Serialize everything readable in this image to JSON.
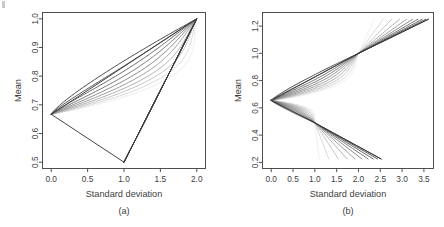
{
  "figure": {
    "background": "#ffffff",
    "ink": "#3d3d3d"
  },
  "chart_data": [
    {
      "type": "line",
      "panel_label": "(a)",
      "title": "",
      "xlabel": "Standard deviation",
      "ylabel": "Mean",
      "xlim": [
        -0.12,
        2.12
      ],
      "ylim": [
        0.478,
        1.022
      ],
      "xticks": [
        "0.0",
        "0.5",
        "1.0",
        "1.5",
        "2.0"
      ],
      "xtick_values": [
        0.0,
        0.5,
        1.0,
        1.5,
        2.0
      ],
      "yticks": [
        "0.5",
        "0.6",
        "0.7",
        "0.8",
        "0.9",
        "1.0"
      ],
      "ytick_values": [
        0.5,
        0.6,
        0.7,
        0.8,
        0.9,
        1.0
      ],
      "grid": false,
      "legend": "none",
      "n_curves": 10,
      "shared_apex_top": [
        2.0,
        1.0
      ],
      "shared_apex_bottom": [
        1.0,
        0.5
      ],
      "left_cusp": [
        0.0,
        0.667
      ],
      "curve_shading": [
        "#3c3c3c",
        "#f0f0f0"
      ],
      "series": [
        {
          "name": "curve-1",
          "color": "#3a3a3a",
          "x": [
            0.0,
            0.02,
            0.06,
            0.14,
            0.26,
            0.42,
            0.6,
            0.78,
            0.9,
            0.97,
            1.0,
            1.18,
            1.4,
            1.62,
            1.82,
            2.0
          ],
          "y": [
            0.667,
            0.69,
            0.725,
            0.772,
            0.82,
            0.866,
            0.906,
            0.94,
            0.962,
            0.98,
            1.0,
            0.905,
            0.79,
            0.69,
            0.594,
            0.5
          ],
          "note": "outermost triangle-like hull; upper branch 0.667->1.0 at sd 2.0, lower branch back to 1.0,0.5"
        },
        {
          "name": "curve-2",
          "color": "#4a4a4a",
          "bulge": 0.4
        },
        {
          "name": "curve-3",
          "color": "#5c5c5c",
          "bulge": 0.5
        },
        {
          "name": "curve-4",
          "color": "#6e6e6e",
          "bulge": 0.58
        },
        {
          "name": "curve-5",
          "color": "#828282",
          "bulge": 0.66
        },
        {
          "name": "curve-6",
          "color": "#969696",
          "bulge": 0.73
        },
        {
          "name": "curve-7",
          "color": "#aaaaaa",
          "bulge": 0.79
        },
        {
          "name": "curve-8",
          "color": "#bfbfbf",
          "bulge": 0.85
        },
        {
          "name": "curve-9",
          "color": "#d6d6d6",
          "bulge": 0.91
        },
        {
          "name": "curve-10",
          "color": "#ececec",
          "bulge": 0.96
        }
      ]
    },
    {
      "type": "line",
      "panel_label": "(b)",
      "title": "",
      "xlabel": "Standard deviation",
      "ylabel": "Mean",
      "xlim": [
        -0.2,
        3.72
      ],
      "ylim": [
        0.155,
        1.3
      ],
      "xticks": [
        "0.0",
        "0.5",
        "1.0",
        "1.5",
        "2.0",
        "2.5",
        "3.0",
        "3.5"
      ],
      "xtick_values": [
        0.0,
        0.5,
        1.0,
        1.5,
        2.0,
        2.5,
        3.0,
        3.5
      ],
      "yticks": [
        "0.2",
        "0.4",
        "0.6",
        "0.8",
        "1.0",
        "1.2"
      ],
      "ytick_values": [
        0.2,
        0.4,
        0.6,
        0.8,
        1.0,
        1.2
      ],
      "grid": false,
      "legend": "none",
      "n_curves": 10,
      "waist_upper": [
        2.0,
        1.0
      ],
      "waist_lower": [
        1.0,
        0.49
      ],
      "left_cusp": [
        0.0,
        0.655
      ],
      "curve_shading": [
        "#3c3c3c",
        "#f0f0f0"
      ],
      "upper_ray_end_mean": 1.25,
      "lower_ray_end_mean": 0.225,
      "series": [
        {
          "name": "curve-1",
          "color": "#3a3a3a",
          "upper_end_x": 3.6,
          "lower_end_x": 2.52
        },
        {
          "name": "curve-2",
          "color": "#4a4a4a",
          "upper_end_x": 3.54,
          "lower_end_x": 2.44
        },
        {
          "name": "curve-3",
          "color": "#5c5c5c",
          "upper_end_x": 3.46,
          "lower_end_x": 2.34
        },
        {
          "name": "curve-4",
          "color": "#6e6e6e",
          "upper_end_x": 3.36,
          "lower_end_x": 2.22
        },
        {
          "name": "curve-5",
          "color": "#828282",
          "upper_end_x": 3.24,
          "lower_end_x": 2.08
        },
        {
          "name": "curve-6",
          "color": "#969696",
          "upper_end_x": 3.1,
          "lower_end_x": 1.92
        },
        {
          "name": "curve-7",
          "color": "#aaaaaa",
          "upper_end_x": 2.94,
          "lower_end_x": 1.74
        },
        {
          "name": "curve-8",
          "color": "#bfbfbf",
          "upper_end_x": 2.76,
          "lower_end_x": 1.54
        },
        {
          "name": "curve-9",
          "color": "#d6d6d6",
          "upper_end_x": 2.56,
          "lower_end_x": 1.32
        },
        {
          "name": "curve-10",
          "color": "#ececec",
          "upper_end_x": 2.36,
          "lower_end_x": 1.1
        }
      ]
    }
  ]
}
